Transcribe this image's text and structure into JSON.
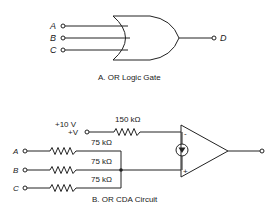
{
  "figure_a": {
    "caption": "A.  OR Logic Gate",
    "gate_type": "OR",
    "inputs": [
      "A",
      "B",
      "C"
    ],
    "output": "D"
  },
  "figure_b": {
    "caption": "B.  OR CDA Circuit",
    "supply_voltage": "+10 V",
    "supply_label": "+V",
    "feedback_resistor": "150 kΩ",
    "inputs": [
      {
        "label": "A",
        "resistor": "75 kΩ"
      },
      {
        "label": "B",
        "resistor": "75 kΩ"
      },
      {
        "label": "C",
        "resistor": "75 kΩ"
      }
    ],
    "opamp_inverting": "-",
    "opamp_noninverting": "+"
  },
  "colors": {
    "line": "#222222",
    "background": "#ffffff"
  }
}
